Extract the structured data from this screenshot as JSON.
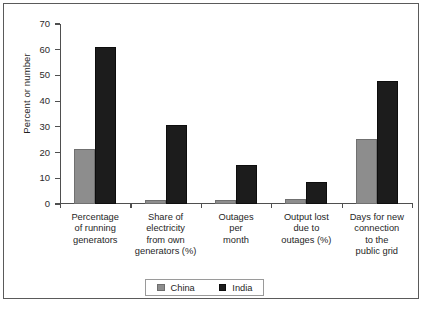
{
  "chart_data": {
    "type": "bar",
    "title": "",
    "xlabel": "",
    "ylabel": "Percent or number",
    "ylim": [
      0,
      70
    ],
    "ytick_values": [
      0,
      10,
      20,
      30,
      40,
      50,
      60,
      70
    ],
    "ytick_labels": [
      "0",
      "10",
      "20",
      "30",
      "40",
      "50",
      "60",
      "70"
    ],
    "grid": false,
    "legend_position": "bottom-center",
    "categories": [
      "Percentage of running generators",
      "Share of electricity from own generators (%)",
      "Outages per month",
      "Output lost due to outages (%)",
      "Days for new connection to the public grid"
    ],
    "category_lines": [
      [
        "Percentage",
        "of running",
        "generators"
      ],
      [
        "Share of",
        "electricity",
        "from own",
        "generators (%)"
      ],
      [
        "Outages",
        "per",
        "month"
      ],
      [
        "Output lost",
        "due to",
        "outages (%)"
      ],
      [
        "Days for new",
        "connection",
        "to the",
        "public grid"
      ]
    ],
    "series": [
      {
        "name": "China",
        "color": "#8d8d8d",
        "values": [
          21.3,
          1.5,
          1.7,
          1.8,
          25.3
        ]
      },
      {
        "name": "India",
        "color": "#1c1c1c",
        "values": [
          61.0,
          30.7,
          15.3,
          8.4,
          48.0
        ]
      }
    ]
  },
  "legend": {
    "entries": [
      {
        "label": "China",
        "color": "#8d8d8d"
      },
      {
        "label": "India",
        "color": "#1c1c1c"
      }
    ]
  },
  "caption": {
    "text": ""
  }
}
